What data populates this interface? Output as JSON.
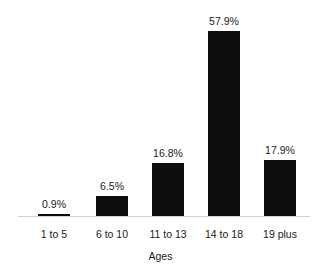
{
  "chart_data": {
    "type": "bar",
    "title": "",
    "subtitle": "",
    "xlabel": "Ages",
    "ylabel": "",
    "categories": [
      "1 to 5",
      "6 to 10",
      "11 to 13",
      "14 to 18",
      "19 plus"
    ],
    "values": [
      0.9,
      6.5,
      16.8,
      57.9,
      17.9
    ],
    "value_labels": [
      "0.9%",
      "6.5%",
      "16.8%",
      "57.9%",
      "17.9%"
    ],
    "ylim": [
      0,
      57.9
    ],
    "grid": false,
    "legend": false,
    "legend_position": "none",
    "bar_color": "#0d0d0d",
    "axis_color": "#d2d2d2",
    "background_color": "#ffffff",
    "text_color": "#1a1a1a"
  }
}
